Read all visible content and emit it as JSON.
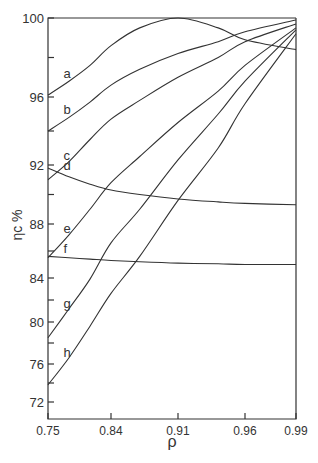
{
  "chart_data": {
    "type": "line",
    "title": "",
    "xlabel": "ρ",
    "ylabel": "ηc %",
    "x_ticks": [
      0.75,
      0.84,
      0.91,
      0.96,
      0.99
    ],
    "x_tick_labels": [
      "0.75",
      "0.84",
      "0.91",
      "0.96",
      "0.99"
    ],
    "y_ticks": [
      72,
      74,
      76,
      78,
      80,
      82,
      84,
      86,
      88,
      90,
      92,
      94,
      96,
      98,
      100
    ],
    "y_tick_labels": [
      "72",
      "76",
      "80",
      "84",
      "88",
      "92",
      "96",
      "100"
    ],
    "xlim": [
      0.75,
      0.99
    ],
    "ylim": [
      70.5,
      100
    ],
    "grid": false,
    "legend": "inline curve labels a–h",
    "x": [
      0.75,
      0.78,
      0.81,
      0.84,
      0.87,
      0.91,
      0.94,
      0.96,
      0.99
    ],
    "series": [
      {
        "name": "a",
        "values": [
          96.1,
          96.8,
          97.6,
          98.6,
          99.5,
          100.0,
          99.5,
          98.9,
          98.4
        ]
      },
      {
        "name": "b",
        "values": [
          94.0,
          94.8,
          95.7,
          96.6,
          97.4,
          98.2,
          98.8,
          99.3,
          99.9
        ]
      },
      {
        "name": "c",
        "values": [
          91.0,
          92.2,
          93.5,
          94.7,
          95.8,
          97.0,
          98.0,
          98.8,
          99.7
        ]
      },
      {
        "name": "d",
        "values": [
          91.8,
          91.2,
          90.7,
          90.3,
          90.0,
          89.7,
          89.5,
          89.4,
          89.3
        ]
      },
      {
        "name": "e",
        "values": [
          85.5,
          87.2,
          89.0,
          90.8,
          92.5,
          94.5,
          96.3,
          97.6,
          99.5
        ]
      },
      {
        "name": "f",
        "values": [
          85.6,
          85.5,
          85.4,
          85.3,
          85.2,
          85.1,
          85.05,
          85.0,
          85.0
        ]
      },
      {
        "name": "g",
        "values": [
          78.5,
          81.2,
          83.9,
          86.6,
          89.0,
          92.3,
          95.0,
          96.8,
          99.4
        ]
      },
      {
        "name": "h",
        "values": [
          73.8,
          76.6,
          79.6,
          82.6,
          85.6,
          89.6,
          93.0,
          95.6,
          99.2
        ]
      }
    ]
  }
}
